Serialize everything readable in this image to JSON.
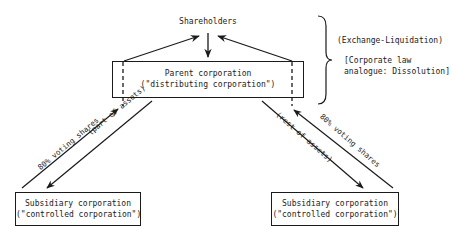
{
  "diagram": {
    "shareholders": "Shareholders",
    "parent": {
      "line1": "Parent corporation",
      "line2": "(\"distributing corporation\")"
    },
    "subsidiary_left": {
      "line1": "Subsidiary corporation",
      "line2": "(\"controlled corporation\")"
    },
    "subsidiary_right": {
      "line1": "Subsidiary corporation",
      "line2": "(\"controlled corporation\")"
    },
    "arrows": {
      "left_up": "80% voting shares",
      "left_down": "(part of assets)",
      "right_down": "(rest of assets)",
      "right_up": "80% voting shares"
    },
    "annotation": {
      "title": "(Exchange-Liquidation)",
      "note_line1": "[Corporate law",
      "note_line2": "analogue:  Dissolution]"
    }
  }
}
